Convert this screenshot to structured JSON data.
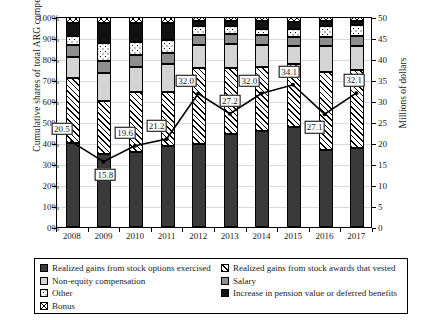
{
  "axes": {
    "left_title": "Cumulative shares of total ARG compensation",
    "right_title": "Millions of dollars",
    "left_ticks": [
      "100%",
      "90%",
      "80%",
      "70%",
      "60%",
      "50%",
      "40%",
      "30%",
      "20%",
      "10%",
      "0%"
    ],
    "right_ticks": [
      "50",
      "45",
      "40",
      "35",
      "30",
      "25",
      "20",
      "15",
      "10",
      "5",
      "0"
    ]
  },
  "legend": {
    "items": [
      {
        "label": "Realized gains from stock options exercised",
        "swatch": "options-swatch"
      },
      {
        "label": "Non-equity compensation",
        "swatch": "nonequity-swatch"
      },
      {
        "label": "Other",
        "swatch": "other-swatch"
      },
      {
        "label": "Bonus",
        "swatch": "bonus-swatch"
      },
      {
        "label": "Realized gains from stock awards that vested",
        "swatch": "stockawards-swatch"
      },
      {
        "label": "Salary",
        "swatch": "salary-swatch"
      },
      {
        "label": "Increase in pension value or deferred benefits",
        "swatch": "pension-swatch"
      }
    ]
  },
  "chart_data": {
    "type": "bar",
    "title": "",
    "xlabel": "",
    "ylabel": "Cumulative shares of total ARG compensation",
    "y2label": "Millions of dollars",
    "ylim": [
      0,
      100
    ],
    "y2lim": [
      0,
      50
    ],
    "grid": true,
    "legend_position": "bottom",
    "categories": [
      "2008",
      "2009",
      "2010",
      "2011",
      "2012",
      "2013",
      "2014",
      "2015",
      "2016",
      "2017"
    ],
    "stacked_series": [
      {
        "name": "Realized gains from stock options exercised",
        "values": [
          40.0,
          35.0,
          35.5,
          38.5,
          39.5,
          44.5,
          45.5,
          47.5,
          36.5,
          37.5
        ]
      },
      {
        "name": "Realized gains from stock awards that vested",
        "values": [
          31.0,
          25.0,
          29.0,
          26.0,
          36.0,
          31.0,
          30.5,
          30.0,
          37.5,
          37.5
        ]
      },
      {
        "name": "Non-equity compensation",
        "values": [
          10.0,
          13.5,
          11.5,
          13.0,
          11.0,
          11.5,
          10.5,
          8.5,
          12.0,
          11.0
        ]
      },
      {
        "name": "Salary",
        "values": [
          5.5,
          5.5,
          6.0,
          5.5,
          5.0,
          5.0,
          5.0,
          4.5,
          4.5,
          5.0
        ]
      },
      {
        "name": "Other",
        "values": [
          4.5,
          8.5,
          6.0,
          6.0,
          4.0,
          3.5,
          3.0,
          4.0,
          5.0,
          5.0
        ]
      },
      {
        "name": "Increase in pension value or deferred benefits",
        "values": [
          6.0,
          9.5,
          9.0,
          8.0,
          2.5,
          2.5,
          3.5,
          3.0,
          2.5,
          2.0
        ]
      },
      {
        "name": "Bonus",
        "values": [
          3.0,
          3.0,
          3.0,
          3.0,
          2.0,
          2.0,
          2.0,
          2.5,
          2.0,
          2.0
        ]
      }
    ],
    "line_series": {
      "name": "Total compensation",
      "axis": "right",
      "values": [
        20.5,
        15.8,
        19.6,
        21.2,
        32.0,
        27.2,
        32.0,
        34.1,
        27.1,
        32.1
      ],
      "labels": [
        "20.5",
        "15.8",
        "19.6",
        "21.2",
        "32.0",
        "27.2",
        "32.0",
        "34.1",
        "27.1",
        "32.1"
      ]
    }
  },
  "colors": {
    "options": "#3a3a3a",
    "nonequity": "#d4d4d4",
    "salary": "#8e8e8e",
    "pension": "#111111",
    "line": "#000000",
    "grid": "#d9d9d9"
  }
}
